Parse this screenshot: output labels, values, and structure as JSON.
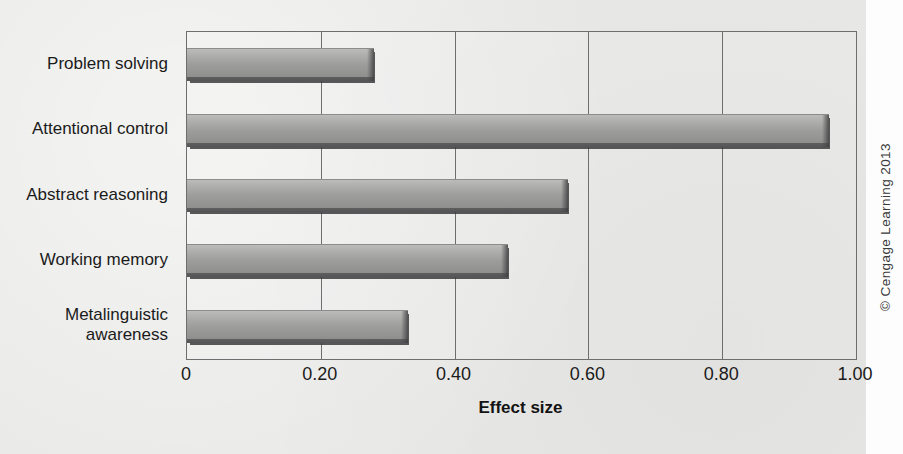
{
  "figure": {
    "background_color": "#e9e9e7",
    "bar_color": "#9d9d9c",
    "axis_color": "#6e6e70",
    "copyright": "© Cengage Learning 2013"
  },
  "chart_data": {
    "type": "bar",
    "orientation": "horizontal",
    "title": "",
    "xlabel": "Effect size",
    "ylabel": "",
    "categories": [
      "Problem solving",
      "Attentional control",
      "Abstract reasoning",
      "Working memory",
      "Metalinguistic\nawareness"
    ],
    "values": [
      0.28,
      0.96,
      0.57,
      0.48,
      0.33
    ],
    "xlim": [
      0,
      1.0
    ],
    "xticks": [
      0,
      0.2,
      0.4,
      0.6,
      0.8,
      1.0
    ],
    "xticklabels": [
      "0",
      "0.20",
      "0.40",
      "0.60",
      "0.80",
      "1.00"
    ],
    "grid": "vertical",
    "legend": "none"
  }
}
